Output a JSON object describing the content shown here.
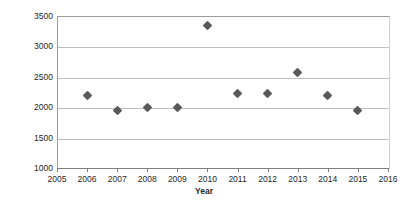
{
  "chart_data": {
    "type": "scatter",
    "title": "",
    "xlabel": "Year",
    "ylabel": "Average annual rainfall (mm)",
    "xlim": [
      2005,
      2016
    ],
    "ylim": [
      1000,
      3500
    ],
    "xticks": [
      2005,
      2006,
      2007,
      2008,
      2009,
      2010,
      2011,
      2012,
      2013,
      2014,
      2015,
      2016
    ],
    "yticks": [
      1000,
      1500,
      2000,
      2500,
      3000,
      3500
    ],
    "grid": "horizontal",
    "legend": "none",
    "marker": "diamond",
    "marker_color": "#595959",
    "x": [
      2006,
      2007,
      2008,
      2009,
      2010,
      2011,
      2012,
      2013,
      2014,
      2015
    ],
    "values": [
      2200,
      1940,
      2000,
      1990,
      3350,
      2230,
      2225,
      2570,
      2200,
      1940
    ],
    "points": [
      {
        "year": 2006,
        "rainfall": 2200
      },
      {
        "year": 2007,
        "rainfall": 1940
      },
      {
        "year": 2008,
        "rainfall": 2000
      },
      {
        "year": 2009,
        "rainfall": 1990
      },
      {
        "year": 2010,
        "rainfall": 3350
      },
      {
        "year": 2011,
        "rainfall": 2230
      },
      {
        "year": 2012,
        "rainfall": 2225
      },
      {
        "year": 2013,
        "rainfall": 2570
      },
      {
        "year": 2014,
        "rainfall": 2200
      },
      {
        "year": 2015,
        "rainfall": 1940
      }
    ]
  },
  "axes": {
    "y_title": "Average annual rainfall (mm)",
    "x_title": "Year",
    "y_tick_labels": [
      "3500",
      "3000",
      "2500",
      "2000",
      "1500",
      "1000"
    ],
    "x_tick_labels": [
      "2005",
      "2006",
      "2007",
      "2008",
      "2009",
      "2010",
      "2011",
      "2012",
      "2013",
      "2014",
      "2015",
      "2016"
    ]
  },
  "colors": {
    "marker": "#595959",
    "gridline": "#bfbfbf",
    "axis": "#7f7f7f",
    "text": "#262626",
    "background": "#ffffff"
  }
}
